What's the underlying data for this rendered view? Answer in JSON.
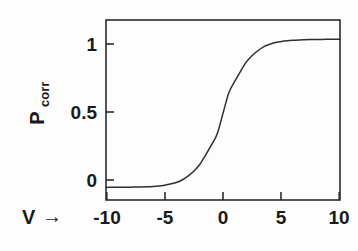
{
  "figure": {
    "background_color": "#fdfdfd",
    "ink_color": "#2b2b2b"
  },
  "chart_data": {
    "type": "line",
    "title": "",
    "subtitle": "",
    "xlabel": "V →",
    "xlabel_symbol": "V",
    "xlabel_arrow": "→",
    "ylabel": "Pcorr",
    "ylabel_base": "P",
    "ylabel_subscript": "corr",
    "xlim": [
      -10,
      10
    ],
    "ylim": [
      -0.085,
      1.13
    ],
    "xticks": [
      -10,
      -5,
      0,
      5,
      10
    ],
    "xtick_labels": [
      "-10",
      "-5",
      "0",
      "5",
      "10"
    ],
    "yticks": [
      0,
      0.5,
      1
    ],
    "ytick_labels": [
      "0",
      "0.5",
      "1"
    ],
    "grid": false,
    "legend": null,
    "legend_position": "none",
    "tick_direction": "in",
    "series": [
      {
        "name": "P_corr(V)",
        "description": "logistic sigmoid 1/(1+exp(-V/1.2))",
        "color": "#2e2e2e",
        "x": [
          -10,
          -9.5,
          -9,
          -8.5,
          -8,
          -7.5,
          -7,
          -6.5,
          -6,
          -5.5,
          -5,
          -4.5,
          -4,
          -3.5,
          -3,
          -2.5,
          -2,
          -1.5,
          -1,
          -0.5,
          0,
          0.5,
          1,
          1.5,
          2,
          2.5,
          3,
          3.5,
          4,
          4.5,
          5,
          5.5,
          6,
          6.5,
          7,
          7.5,
          8,
          8.5,
          9,
          9.5,
          10
        ],
        "values": [
          0.0002,
          0.0004,
          0.0006,
          0.0009,
          0.0013,
          0.002,
          0.0029,
          0.0043,
          0.0066,
          0.0099,
          0.0149,
          0.0223,
          0.0335,
          0.0498,
          0.0759,
          0.1091,
          0.1529,
          0.2163,
          0.2847,
          0.3605,
          0.5,
          0.6395,
          0.7153,
          0.7837,
          0.8471,
          0.8909,
          0.9241,
          0.9502,
          0.9665,
          0.9777,
          0.9851,
          0.9901,
          0.9934,
          0.9957,
          0.9971,
          0.998,
          0.9987,
          0.9991,
          0.9994,
          0.9996,
          0.9998
        ]
      }
    ],
    "annotations": [],
    "midpoint": {
      "x": 0,
      "y": 0.5
    },
    "asymptotes": {
      "low": 0,
      "high": 1
    }
  }
}
